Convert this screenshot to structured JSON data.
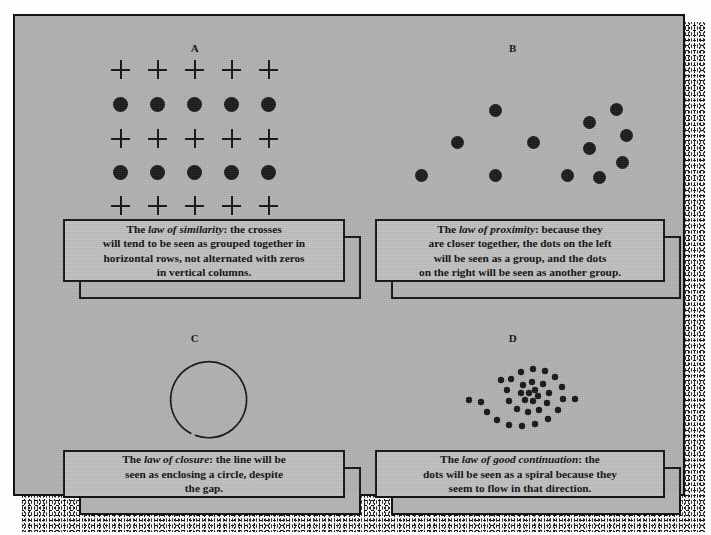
{
  "figure": {
    "background_color": "#b2b2b2",
    "ink_color": "#141414",
    "panels": [
      {
        "label": "A",
        "law": "law of similarity",
        "caption_lead": "The ",
        "caption_rest": ": the crosses will tend to be seen as grouped together in horizontal rows, not alternated with zeros in vertical columns.",
        "caption_lines": [
          "The law of similarity: the crosses",
          "will tend to be seen as grouped together in",
          "horizontal rows, not alternated with zeros",
          "in vertical columns."
        ],
        "stimulus": "grid-of-crosses-and-dots",
        "grid_rows": 5,
        "grid_cols": 5,
        "row_types": [
          "cross",
          "dot",
          "cross",
          "dot",
          "cross"
        ]
      },
      {
        "label": "B",
        "law": "law of proximity",
        "caption_lead": "The ",
        "caption_rest": ": because they are closer together, the dots on the left will be seen as a group, and the dots on the right will be seen as another group.",
        "caption_lines": [
          "The law of proximity: because they",
          "are closer together, the dots on the left",
          "will be seen as a group, and the dots",
          "on the right will be seen as another group."
        ],
        "stimulus": "two-dot-clusters",
        "left_group_count": 6,
        "right_group_count": 6
      },
      {
        "label": "C",
        "law": "law of closure",
        "caption_lead": "The ",
        "caption_rest": ": the line will be seen as enclosing a circle, despite the gap.",
        "caption_lines": [
          "The law of closure: the line will be",
          "seen as enclosing a circle, despite",
          "the gap."
        ],
        "stimulus": "circle-with-gap",
        "gap_position": "lower-left"
      },
      {
        "label": "D",
        "law": "law of good continuation",
        "caption_lead": "The ",
        "caption_rest": ": the dots will be seen as a spiral because they seem to flow in that direction.",
        "caption_lines": [
          "The law of good continuation: the",
          "dots will be seen as a spiral because they",
          "seem to flow in that direction."
        ],
        "stimulus": "spiral-of-dots",
        "dot_count": 34
      }
    ]
  }
}
